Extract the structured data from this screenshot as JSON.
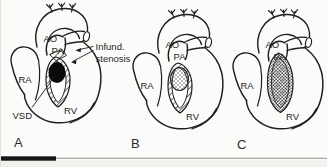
{
  "figure": {
    "colors": {
      "ink": "#1f1f1f",
      "background": "#fbfbf9",
      "vsd_fill": "#0a0a0a",
      "scale_bar_fill": "#161616"
    },
    "panels": [
      {
        "caption": "A",
        "ao": "AO",
        "pa": "PA",
        "ra": "RA",
        "rv": "RV"
      },
      {
        "caption": "B",
        "ao": "AO",
        "pa": "PA",
        "ra": "RA",
        "rv": "RV"
      },
      {
        "caption": "C",
        "ao": "AO",
        "pa": "PA",
        "ra": "RA",
        "rv": "RV"
      }
    ],
    "annotations": {
      "infund_line1": "Infund.",
      "infund_line2": "stenosis",
      "vsd": "VSD"
    }
  }
}
